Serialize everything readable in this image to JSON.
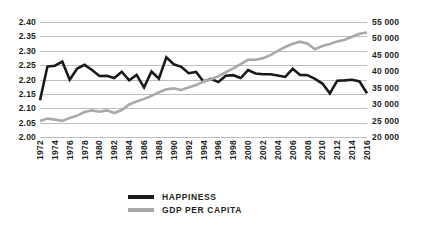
{
  "chart_data": {
    "type": "line",
    "title": "",
    "xlabel": "",
    "ylabel": "",
    "grid": true,
    "legend_position": "bottom-center",
    "x": [
      1972,
      1973,
      1974,
      1975,
      1976,
      1977,
      1978,
      1979,
      1980,
      1981,
      1982,
      1983,
      1984,
      1985,
      1986,
      1987,
      1988,
      1989,
      1990,
      1991,
      1992,
      1993,
      1994,
      1995,
      1996,
      1997,
      1998,
      1999,
      2000,
      2001,
      2002,
      2003,
      2004,
      2005,
      2006,
      2007,
      2008,
      2009,
      2010,
      2011,
      2012,
      2013,
      2014,
      2015,
      2016
    ],
    "x_tick_labels": [
      "1972",
      "1974",
      "1976",
      "1978",
      "1980",
      "1982",
      "1984",
      "1986",
      "1988",
      "1990",
      "1992",
      "1994",
      "1996",
      "1998",
      "2000",
      "2002",
      "2004",
      "2006",
      "2008",
      "2010",
      "2012",
      "2014",
      "2016"
    ],
    "axes": [
      {
        "id": "left",
        "side": "left",
        "ylim": [
          2.0,
          2.4
        ],
        "ytick_step": 0.05,
        "ytick_labels": [
          "2.40",
          "2.35",
          "2.30",
          "2.25",
          "2.20",
          "2.15",
          "2.10",
          "2.05",
          "2.00"
        ],
        "ytick_values": [
          2.4,
          2.35,
          2.3,
          2.25,
          2.2,
          2.15,
          2.1,
          2.05,
          2.0
        ]
      },
      {
        "id": "right",
        "side": "right",
        "ylim": [
          20000,
          55000
        ],
        "ytick_step": 5000,
        "ytick_labels": [
          "55 000",
          "50 000",
          "45 000",
          "40 000",
          "35 000",
          "30 000",
          "25 000",
          "20 000"
        ],
        "ytick_values": [
          55000,
          50000,
          45000,
          40000,
          35000,
          30000,
          25000,
          20000
        ]
      }
    ],
    "series": [
      {
        "name": "HAPPINESS",
        "axis": "left",
        "color": "#1a1a1a",
        "line_width": 2.6,
        "values": [
          2.128,
          2.245,
          2.248,
          2.262,
          2.199,
          2.238,
          2.251,
          2.233,
          2.212,
          2.213,
          2.205,
          2.227,
          2.197,
          2.216,
          2.172,
          2.228,
          2.203,
          2.277,
          2.253,
          2.244,
          2.222,
          2.226,
          2.193,
          2.202,
          2.191,
          2.213,
          2.215,
          2.205,
          2.233,
          2.221,
          2.218,
          2.218,
          2.214,
          2.209,
          2.237,
          2.216,
          2.215,
          2.202,
          2.186,
          2.152,
          2.196,
          2.197,
          2.199,
          2.193,
          2.152
        ]
      },
      {
        "name": "GDP PER CAPITA",
        "axis": "right",
        "color": "#a7a9ac",
        "line_width": 2.6,
        "values": [
          24900,
          25600,
          25300,
          24900,
          25800,
          26500,
          27600,
          28100,
          27700,
          28100,
          27300,
          28200,
          29900,
          30800,
          31600,
          32500,
          33600,
          34500,
          34800,
          34300,
          35100,
          35800,
          36900,
          37600,
          38500,
          39700,
          40900,
          42200,
          43500,
          43500,
          44000,
          44900,
          46200,
          47400,
          48400,
          49000,
          48400,
          46700,
          47700,
          48300,
          49100,
          49600,
          50500,
          51400,
          51800
        ]
      }
    ]
  },
  "legend": {
    "items": [
      {
        "label": "HAPPINESS",
        "color": "#1a1a1a"
      },
      {
        "label": "GDP PER CAPITA",
        "color": "#a7a9ac"
      }
    ]
  },
  "colors": {
    "background": "#ffffff",
    "gridline": "#bcbec0",
    "text": "#231f20",
    "happiness": "#1a1a1a",
    "gdp": "#a7a9ac"
  }
}
